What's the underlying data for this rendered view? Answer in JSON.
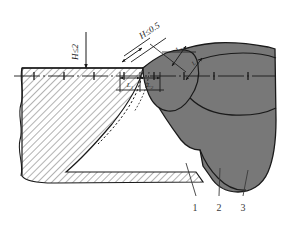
{
  "figure": {
    "background_color": "#ffffff",
    "line_color": "#1a1a1a",
    "weld_fill_color": "#787878",
    "hatch_color": "#555555",
    "base_fill_color": "#ffffff"
  },
  "dimensions": {
    "height_left": {
      "label": "H≤2",
      "name": "height-tolerance-left",
      "rotation": -90
    },
    "height_right": {
      "label": "H≤0.5",
      "name": "height-tolerance-right",
      "rotation": -33
    },
    "gap_segments": [
      {
        "label": "L",
        "sub": "1",
        "name": "gap-dimension-1"
      },
      {
        "label": "L",
        "sub": "2",
        "name": "gap-dimension-2"
      }
    ],
    "bead_segments": [
      {
        "label": "L",
        "sub": "3",
        "name": "bead-dimension-1"
      },
      {
        "label": "L",
        "sub": "4",
        "name": "bead-dimension-2"
      }
    ]
  },
  "callouts": [
    {
      "number": "1",
      "name": "callout-1"
    },
    {
      "number": "2",
      "name": "callout-2"
    },
    {
      "number": "3",
      "name": "callout-3"
    }
  ],
  "geometry": {
    "base_top_y": 68,
    "centerline_y": 76,
    "base_bottom_y": 183
  }
}
